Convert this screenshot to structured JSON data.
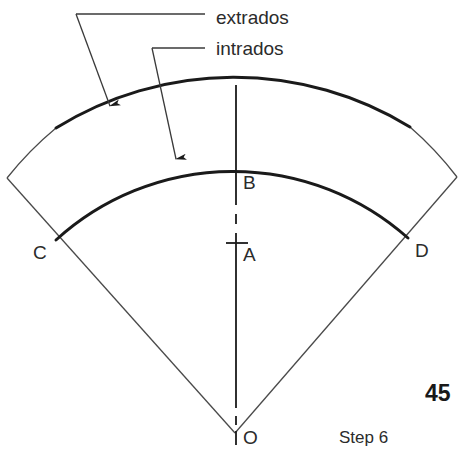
{
  "figure": {
    "type": "engineering-drawing",
    "background_color": "#ffffff",
    "line_color": "#1a1a1a",
    "thin_line_color": "#4a4a4a",
    "text_color": "#2b2b2b"
  },
  "callouts": [
    {
      "id": "extrados",
      "label": "extrados",
      "text_x": 216,
      "text_y": 8,
      "leader": "M76,14 L205,14 M76,14 L110,108",
      "arrow_tip_x": 110,
      "arrow_tip_y": 114
    },
    {
      "id": "intrados",
      "label": "intrados",
      "text_x": 216,
      "text_y": 39,
      "leader": "M152,48 L205,48 M152,48 L176,161",
      "arrow_tip_x": 177,
      "arrow_tip_y": 167
    }
  ],
  "points": [
    {
      "id": "A",
      "label": "A",
      "x": 236,
      "y": 243,
      "label_x": 243,
      "label_y": 245,
      "tick": true
    },
    {
      "id": "B",
      "label": "B",
      "x": 236,
      "y": 170,
      "label_x": 243,
      "label_y": 173,
      "tick": false
    },
    {
      "id": "C",
      "label": "C",
      "x": 56,
      "y": 240,
      "label_x": 33,
      "label_y": 243,
      "tick": false
    },
    {
      "id": "D",
      "label": "D",
      "x": 408,
      "y": 238,
      "label_x": 415,
      "label_y": 241,
      "tick": false
    },
    {
      "id": "O",
      "label": "O",
      "x": 235,
      "y": 433,
      "label_x": 243,
      "label_y": 428,
      "tick": false
    }
  ],
  "geometry": {
    "center_x": 235,
    "center_y": 433,
    "outer_radius": 337,
    "inner_radius": 263,
    "outer_arc_left": {
      "x": 7,
      "y": 178
    },
    "outer_arc_apex": {
      "x": 236,
      "y": 96
    },
    "outer_arc_right": {
      "x": 457,
      "y": 177
    },
    "inner_arc_left": {
      "x": 56,
      "y": 240
    },
    "inner_arc_apex": {
      "x": 236,
      "y": 170
    },
    "inner_arc_right": {
      "x": 408,
      "y": 238
    },
    "centerline_top_y": 85,
    "centerline_bottom_y": 445
  },
  "annotations": {
    "page_number": "45",
    "page_number_x": 425,
    "page_number_y": 382,
    "step_label": "Step 6",
    "step_label_x": 339,
    "step_label_y": 429
  }
}
